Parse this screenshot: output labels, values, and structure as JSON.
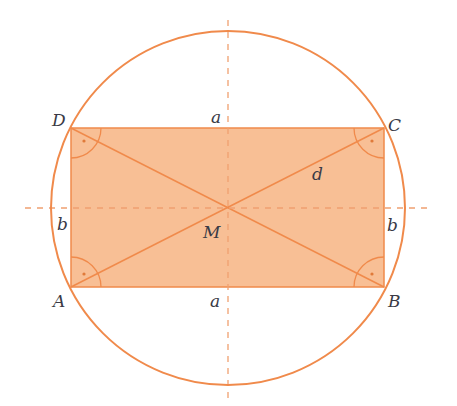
{
  "diagram": {
    "colors": {
      "stroke": "#f08a4b",
      "fill": "#f7b17e",
      "dash": "#f0a070",
      "text": "#3a3a45"
    },
    "vertices": {
      "A": "A",
      "B": "B",
      "C": "C",
      "D": "D"
    },
    "center_label": "M",
    "side_labels": {
      "top": "a",
      "bottom": "a",
      "left": "b",
      "right": "b"
    },
    "diagonal_label": "d"
  }
}
